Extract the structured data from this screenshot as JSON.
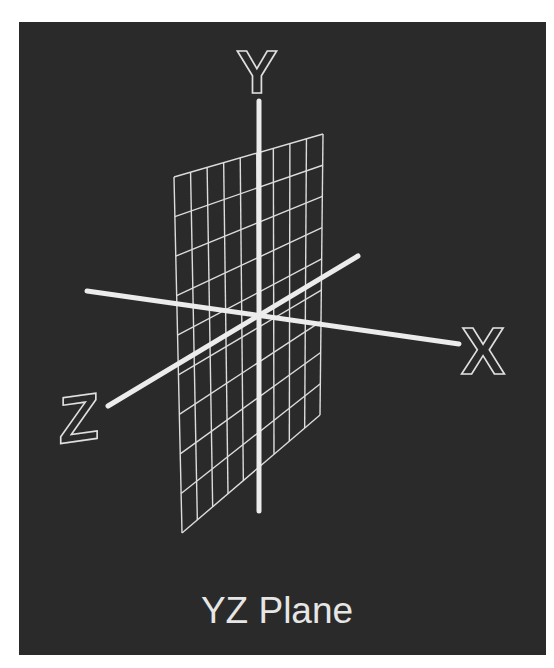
{
  "figure": {
    "title": "YZ Plane",
    "background": "#2a2a2a",
    "page_background": "#ffffff",
    "line_color": "#e8e8e8",
    "axes": [
      {
        "name": "X",
        "label": "X",
        "from": [
          87,
          291
        ],
        "to": [
          459,
          344
        ],
        "label_pos": [
          483,
          374
        ]
      },
      {
        "name": "Y",
        "label": "Y",
        "from": [
          259,
          101
        ],
        "to": [
          259,
          511
        ],
        "label_pos": [
          257,
          93
        ]
      },
      {
        "name": "Z",
        "label": "Z",
        "from": [
          108,
          406
        ],
        "to": [
          358,
          256
        ],
        "label_pos": [
          79,
          441
        ]
      }
    ],
    "grid": {
      "plane": "YZ",
      "columns": 9,
      "rows": 9,
      "corners": {
        "top_left": [
          174,
          177
        ],
        "top_right": [
          323,
          134
        ],
        "bottom_right": [
          320,
          415
        ],
        "bottom_left": [
          182,
          533
        ]
      }
    }
  }
}
